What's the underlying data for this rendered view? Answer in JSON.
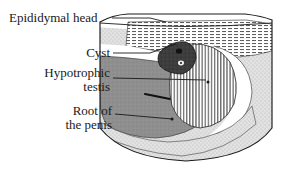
{
  "figure": {
    "type": "medical-illustration",
    "modality": "ultrasound-sector-scan",
    "labels": [
      {
        "id": "epididymal-head",
        "text": "Epididymal head",
        "lines": [
          "Epididymal head"
        ],
        "leader": {
          "x1": 118,
          "y1": 18,
          "x2": 166,
          "y2": 18,
          "elbow_x": 152
        }
      },
      {
        "id": "cyst",
        "text": "Cyst",
        "lines": [
          "Cyst"
        ],
        "leader": {
          "x1": 114,
          "y1": 53,
          "x2": 168,
          "y2": 44
        }
      },
      {
        "id": "hypotrophic-testis",
        "text": "Hypotrophic testis",
        "lines": [
          "Hypotrophic",
          "testis"
        ],
        "leader": {
          "x1": 114,
          "y1": 78,
          "x2": 220,
          "y2": 80
        }
      },
      {
        "id": "root-of-the-penis",
        "text": "Root of the penis",
        "lines": [
          "Root of",
          "the penis"
        ],
        "leader": {
          "x1": 116,
          "y1": 114,
          "x2": 178,
          "y2": 120
        }
      }
    ],
    "regions": [
      {
        "id": "sector-outline",
        "name": "ultrasound-sector-outline",
        "fill": "#ffffff",
        "stroke": "#1a1a1a"
      },
      {
        "id": "near-field-band",
        "name": "epididymal-head-band",
        "fill": "#bdbdbd",
        "pattern": "horizontal-hatch"
      },
      {
        "id": "cyst-blob",
        "name": "cyst",
        "fill": "#3a3a3a",
        "pattern": "solid-dark"
      },
      {
        "id": "cyst-lumen",
        "name": "cyst-lumen",
        "fill": "#f2f2f2"
      },
      {
        "id": "testis-oval",
        "name": "hypotrophic-testis",
        "fill": "#c8c8c8",
        "pattern": "vertical-stripe"
      },
      {
        "id": "hydrocele-crescent",
        "name": "anechoic-crescent",
        "fill": "#ffffff"
      },
      {
        "id": "penile-root",
        "name": "root-of-the-penis",
        "fill": "#8a8a8a",
        "pattern": "solid-mid"
      },
      {
        "id": "urethra-line",
        "name": "urethra-marker",
        "fill": "#111111"
      },
      {
        "id": "far-field",
        "name": "far-field-tissue",
        "fill": "#dcdcdc",
        "pattern": "stipple"
      }
    ],
    "colors": {
      "ink": "#1a1a1a",
      "near_field_band": "#bdbdbd",
      "cyst": "#3a3a3a",
      "testis": "#c8c8c8",
      "penile_root": "#8a8a8a",
      "far_field": "#dcdcdc",
      "anechoic": "#ffffff",
      "background": "#ffffff"
    }
  }
}
